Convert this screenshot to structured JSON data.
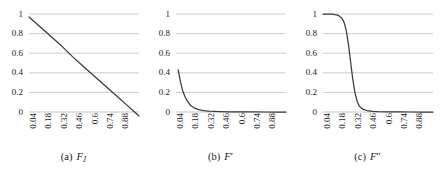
{
  "figure": {
    "panel_count": 3,
    "line_color": "#3a3a3a",
    "grid_color": "#b5b5b5",
    "background": "#ffffff"
  },
  "chart_data": [
    {
      "type": "line",
      "panel": "a",
      "title": "",
      "caption_tag": "(a)",
      "caption_symbol": "F",
      "caption_subscript": "J",
      "caption_prime": "",
      "xlabel": "",
      "ylabel": "",
      "xlim": [
        0.0,
        1.0
      ],
      "ylim": [
        0.0,
        1.0
      ],
      "grid": true,
      "legend": "none",
      "xticklabels": [
        "0.04",
        "0.18",
        "0.32",
        "0.46",
        "0.6",
        "0.74",
        "0.88"
      ],
      "yticklabels": [
        "1",
        "0.8",
        "0.6",
        "0.4",
        "0.2",
        "0"
      ],
      "yticks": [
        1,
        0.8,
        0.6,
        0.4,
        0.2,
        0
      ],
      "x": [
        0.0,
        0.1,
        0.2,
        0.3,
        0.4,
        0.5,
        0.6,
        0.7,
        0.8,
        0.9,
        0.96,
        1.0
      ],
      "values": [
        0.97,
        0.87,
        0.77,
        0.67,
        0.56,
        0.46,
        0.36,
        0.26,
        0.16,
        0.06,
        0.0,
        -0.04
      ]
    },
    {
      "type": "line",
      "panel": "b",
      "title": "",
      "caption_tag": "(b)",
      "caption_symbol": "F",
      "caption_subscript": "",
      "caption_prime": "′",
      "xlabel": "",
      "ylabel": "",
      "xlim": [
        0.0,
        1.0
      ],
      "ylim": [
        0.0,
        1.0
      ],
      "grid": true,
      "legend": "none",
      "xticklabels": [
        "0.04",
        "0.18",
        "0.32",
        "0.46",
        "0.6",
        "0.74",
        "0.88"
      ],
      "yticklabels": [
        "1",
        "0.8",
        "0.6",
        "0.4",
        "0.2",
        "0"
      ],
      "yticks": [
        1,
        0.8,
        0.6,
        0.4,
        0.2,
        0
      ],
      "x": [
        0.02,
        0.04,
        0.06,
        0.08,
        0.1,
        0.13,
        0.16,
        0.2,
        0.25,
        0.3,
        0.4,
        0.5,
        0.6,
        0.7,
        0.8,
        0.9,
        1.0
      ],
      "values": [
        0.43,
        0.31,
        0.22,
        0.16,
        0.115,
        0.07,
        0.045,
        0.026,
        0.014,
        0.008,
        0.004,
        0.002,
        0.001,
        0.001,
        0.0,
        0.0,
        0.0
      ]
    },
    {
      "type": "line",
      "panel": "c",
      "title": "",
      "caption_tag": "(c)",
      "caption_symbol": "F",
      "caption_subscript": "",
      "caption_prime": "″",
      "xlabel": "",
      "ylabel": "",
      "xlim": [
        0.0,
        1.0
      ],
      "ylim": [
        0.0,
        1.0
      ],
      "grid": true,
      "legend": "none",
      "xticklabels": [
        "0.04",
        "0.18",
        "0.32",
        "0.46",
        "0.6",
        "0.74",
        "0.88"
      ],
      "yticklabels": [
        "1",
        "0.8",
        "0.6",
        "0.4",
        "0.2",
        "0"
      ],
      "yticks": [
        1,
        0.8,
        0.6,
        0.4,
        0.2,
        0
      ],
      "x": [
        0.0,
        0.06,
        0.1,
        0.14,
        0.17,
        0.19,
        0.21,
        0.23,
        0.25,
        0.27,
        0.29,
        0.31,
        0.33,
        0.36,
        0.4,
        0.45,
        0.5,
        0.6,
        0.7,
        0.8,
        0.9,
        1.0
      ],
      "values": [
        1.0,
        1.0,
        0.995,
        0.985,
        0.96,
        0.92,
        0.84,
        0.7,
        0.52,
        0.34,
        0.2,
        0.11,
        0.06,
        0.03,
        0.015,
        0.007,
        0.004,
        0.002,
        0.001,
        0.0,
        0.0,
        0.0
      ]
    }
  ]
}
